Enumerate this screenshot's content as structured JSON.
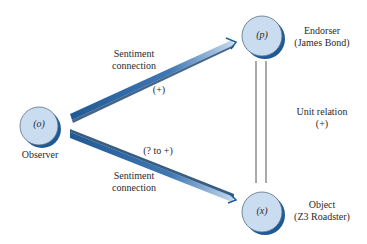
{
  "colors": {
    "node_fill": "#c9dcf0",
    "node_shadow": "#1f5a96",
    "beam_dark": "#1f5a96",
    "beam_light": "#c9dcf0",
    "line": "#555555",
    "text": "#2a2a2a"
  },
  "nodes": {
    "observer": {
      "symbol": "(o)",
      "label": "Observer"
    },
    "endorser": {
      "symbol": "(p)",
      "label_line1": "Endorser",
      "label_line2": "(James Bond)"
    },
    "object": {
      "symbol": "(x)",
      "label_line1": "Object",
      "label_line2": "(Z3 Roadster)"
    }
  },
  "edges": {
    "observer_to_endorser": {
      "label_line1": "Sentiment",
      "label_line2": "connection",
      "sign": "(+)"
    },
    "observer_to_object": {
      "label_line1": "Sentiment",
      "label_line2": "connection",
      "sign": "(? to +)"
    },
    "endorser_object": {
      "label_line1": "Unit relation",
      "label_line2": "(+)"
    }
  }
}
